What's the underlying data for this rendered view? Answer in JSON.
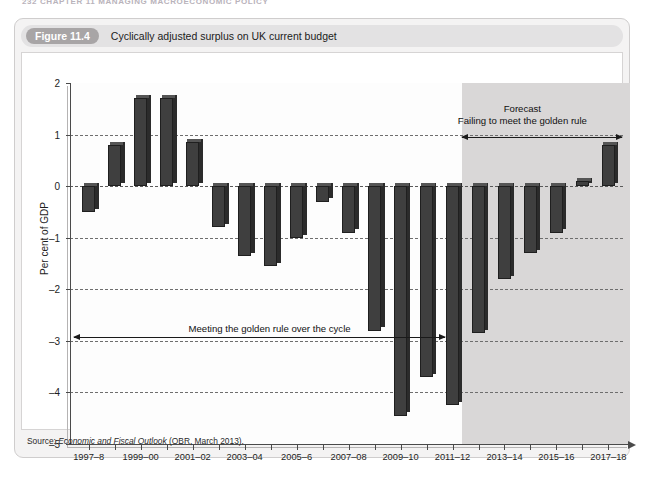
{
  "running_head": "232  CHAPTER 11  MANAGING MACROECONOMIC POLICY",
  "figure": {
    "number_label": "Figure 11.4",
    "title": "Cyclically adjusted surplus on UK current budget",
    "source_prefix": "Source: ",
    "source_italic": "Economic and Fiscal Outlook",
    "source_rest": " (OBR, March 2013)."
  },
  "annotations": {
    "forecast_label": "Forecast",
    "failing_label": "Failing to meet the golden rule",
    "meeting_label": "Meeting the golden rule over the cycle"
  },
  "chart_data": {
    "type": "bar",
    "title": "Cyclically adjusted surplus on UK current budget",
    "xlabel": "",
    "ylabel": "Per cent of GDP",
    "ylim": [
      -5,
      2
    ],
    "ytick_labels": [
      "2",
      "1",
      "0",
      "-1",
      "-2",
      "-3",
      "-4",
      "-5"
    ],
    "yticks": [
      2,
      1,
      0,
      -1,
      -2,
      -3,
      -4,
      -5
    ],
    "grid": true,
    "legend": "none",
    "bar_color": "#3f3f3f",
    "forecast_band_color": "#d9d7d7",
    "forecast_starts_at": "2012-13",
    "xtick_labels": [
      "1997-8",
      "1999-00",
      "2001-02",
      "2003-04",
      "2005-6",
      "2007-08",
      "2009-10",
      "2011-12",
      "2013-14",
      "2015-16",
      "2017-18"
    ],
    "categories": [
      "1997-8",
      "1998-9",
      "1999-00",
      "2000-01",
      "2001-02",
      "2002-03",
      "2003-04",
      "2004-05",
      "2005-6",
      "2006-07",
      "2007-08",
      "2008-09",
      "2009-10",
      "2010-11",
      "2011-12",
      "2012-13",
      "2013-14",
      "2014-15",
      "2015-16",
      "2016-17",
      "2017-18"
    ],
    "values": [
      -0.5,
      0.8,
      1.7,
      1.7,
      0.85,
      -0.8,
      -1.35,
      -1.55,
      -1.0,
      -0.3,
      -0.9,
      -2.8,
      -4.45,
      -3.7,
      -4.25,
      -2.85,
      -1.8,
      -1.3,
      -0.9,
      0.1,
      0.8
    ]
  }
}
